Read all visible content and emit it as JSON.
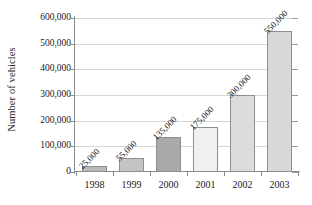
{
  "chart_data": {
    "type": "bar",
    "title": "",
    "xlabel": "",
    "ylabel": "Number of vehicles",
    "categories": [
      "1998",
      "1999",
      "2000",
      "2001",
      "2002",
      "2003"
    ],
    "values": [
      25000,
      55000,
      135000,
      175000,
      300000,
      550000
    ],
    "value_labels": [
      "25,000",
      "55,000",
      "135,000",
      "175,000",
      "300,000",
      "550,000"
    ],
    "bar_colors": [
      "#b9b9b9",
      "#c4c4c4",
      "#a9a9a9",
      "#f0f0f0",
      "#dcdcdc",
      "#d8d8d8"
    ],
    "bar_border_color": "#8f8f8f",
    "ylim": [
      0,
      600000
    ],
    "ytick_values": [
      0,
      100000,
      200000,
      300000,
      400000,
      500000,
      600000
    ],
    "ytick_labels": [
      "0",
      "100,000",
      "200,000",
      "300,000",
      "400,000",
      "500,000",
      "600,000"
    ],
    "grid": true,
    "grid_axis": "y",
    "grid_color": "#d6d6d6",
    "legend": false,
    "legend_position": "none",
    "axis_color": "#8a8a8a",
    "background_color": "#ffffff",
    "value_label_rotation": -45
  }
}
